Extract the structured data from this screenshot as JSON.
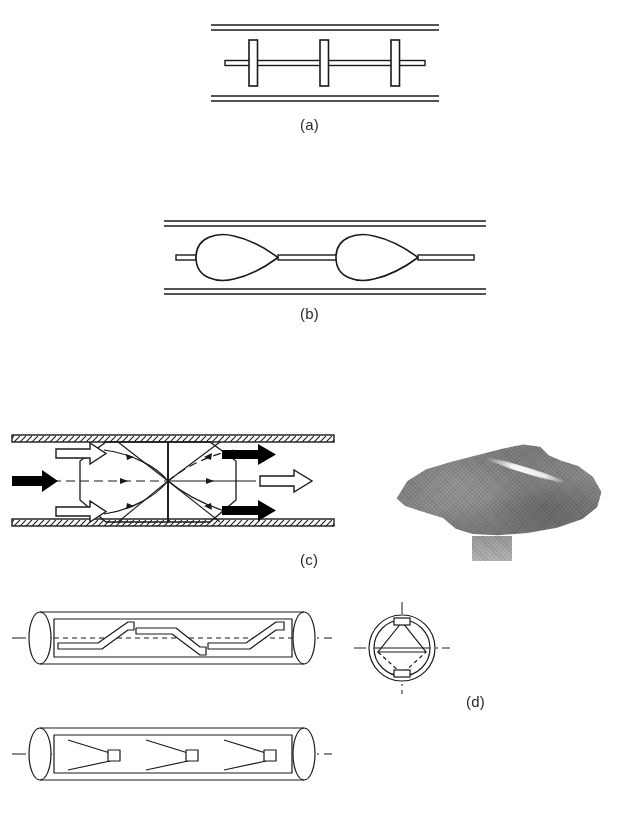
{
  "figure": {
    "kind": "technical-line-drawing-figure",
    "background_color": "#ffffff",
    "line_color": "#1a1a1a",
    "panels": [
      {
        "id": "a",
        "label": "(a)",
        "description": "Disc-type pipeline pig: three flat discs mounted on a central shaft inside a straight pipe shown by two pairs of parallel wall lines.",
        "disc_count": 3,
        "pipe_wall_style": "double-parallel-line"
      },
      {
        "id": "b",
        "label": "(b)",
        "description": "Cup-type pipeline pig: two teardrop / cup shaped sealing elements on a central shaft inside a straight pipe.",
        "cup_count": 2,
        "pipe_wall_style": "double-parallel-line"
      },
      {
        "id": "c",
        "label": "(c)",
        "description": "Bypass flow pig shown in hatched pipe: solid black arrows, open white outline arrows and dashed flow streamlines crossing at a central node.",
        "pipe_wall_style": "hatched",
        "arrows": {
          "solid_black": 3,
          "open_outline": 3,
          "dashed_streamlines": 4
        }
      },
      {
        "id": "d",
        "label": "(d)",
        "description": "Brush / blade pig shown in isometric pipe views with a circular end cross-section.",
        "views": [
          "isometric-pipe-with-angled-blades",
          "circular-cross-section",
          "isometric-pipe-with-v-blades"
        ]
      }
    ],
    "photo": {
      "name": "pig-photograph",
      "description": "Greyscale halftone photograph of a worn pipeline pig body with a bright specular highlight along its upper edge and a lighter stem below.",
      "tone": "greyscale-halftone"
    }
  },
  "labels": {
    "a": "(a)",
    "b": "(b)",
    "c": "(c)",
    "d": "(d)"
  }
}
